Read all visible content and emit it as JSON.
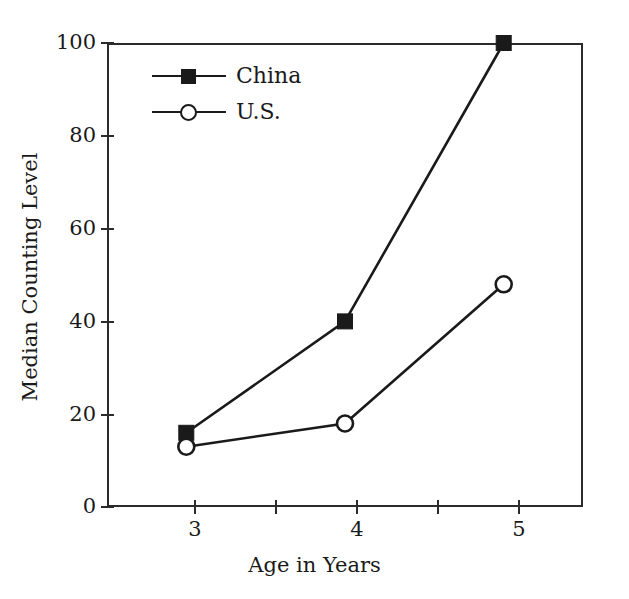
{
  "chart_data": {
    "type": "line",
    "title": "",
    "xlabel": "Age in Years",
    "ylabel": "Median Counting Level",
    "x": [
      3,
      4,
      5
    ],
    "categories": [
      "3",
      "4",
      "5"
    ],
    "series": [
      {
        "name": "China",
        "marker": "filled-square",
        "values": [
          16,
          40,
          100
        ]
      },
      {
        "name": "U.S.",
        "marker": "open-circle",
        "values": [
          13,
          18,
          48
        ]
      }
    ],
    "xlim": [
      2.5,
      5.5
    ],
    "ylim": [
      0,
      100
    ],
    "xticks": [
      "3",
      "4",
      "5"
    ],
    "xticks_minor": [
      "3.5",
      "4.5"
    ],
    "yticks": [
      "0",
      "20",
      "40",
      "60",
      "80",
      "100"
    ],
    "grid": false,
    "legend_position": "top-left-inside",
    "line_color": "#1a1a1a",
    "frame_color": "#2b2b2b"
  },
  "legend": {
    "entries": [
      {
        "label": "China"
      },
      {
        "label": "U.S."
      }
    ]
  },
  "axes": {
    "y_tick_labels": [
      "100",
      "80",
      "60",
      "40",
      "20",
      "0"
    ],
    "x_tick_labels": [
      "3",
      "4",
      "5"
    ],
    "x_title": "Age in Years",
    "y_title": "Median Counting Level"
  }
}
